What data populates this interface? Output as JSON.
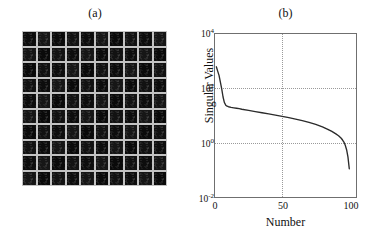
{
  "figure": {
    "panels": [
      {
        "id": "a",
        "title": "(a)",
        "type": "image-mosaic",
        "rows": 10,
        "cols": 10,
        "description": "grid of dark face image patches",
        "tile_color": "#0d0d0d",
        "grid_color": "#c2c2c2"
      },
      {
        "id": "b",
        "title": "(b)",
        "type": "line-plot"
      }
    ]
  },
  "chart_data": {
    "type": "line",
    "title": "(b)",
    "xlabel": "Number",
    "ylabel": "Singular Values",
    "yscale": "log",
    "xscale": "linear",
    "xlim": [
      0,
      105
    ],
    "ylim": [
      0.01,
      10000
    ],
    "grid": true,
    "legend": null,
    "xticks": [
      0,
      50,
      100
    ],
    "xticklabels": [
      "0",
      "50",
      "100"
    ],
    "yticks": [
      0.01,
      1,
      100,
      10000
    ],
    "yticklabels": [
      "10⁻²",
      "10⁰",
      "10²",
      "10⁴"
    ],
    "line_color": "#2b2b2b",
    "x": [
      1,
      2,
      3,
      4,
      5,
      6,
      7,
      8,
      9,
      10,
      12,
      14,
      16,
      18,
      20,
      25,
      30,
      35,
      40,
      45,
      50,
      55,
      60,
      65,
      70,
      75,
      80,
      84,
      87,
      90,
      92,
      94,
      95,
      96,
      97,
      98,
      99,
      100
    ],
    "values": [
      620,
      430,
      300,
      170,
      95,
      48,
      30,
      24,
      22,
      21,
      20,
      19.2,
      18.5,
      17.8,
      17.0,
      15.4,
      13.9,
      12.6,
      11.4,
      10.3,
      9.3,
      8.3,
      7.4,
      6.5,
      5.6,
      4.7,
      3.8,
      3.1,
      2.6,
      2.1,
      1.8,
      1.45,
      1.25,
      1.05,
      0.8,
      0.55,
      0.3,
      0.11
    ],
    "series_name": "singular values"
  },
  "ytick_labels": {
    "t4": {
      "base": "10",
      "exp": "4"
    },
    "t2": {
      "base": "10",
      "exp": "2"
    },
    "t0": {
      "base": "10",
      "exp": "0"
    },
    "tm2": {
      "base": "10",
      "exp": "-2"
    }
  },
  "xtick_labels": {
    "x0": "0",
    "x50": "50",
    "x100": "100"
  },
  "axis_titles": {
    "x": "Number",
    "y": "Singular Values"
  },
  "panel_titles": {
    "a": "(a)",
    "b": "(b)"
  }
}
